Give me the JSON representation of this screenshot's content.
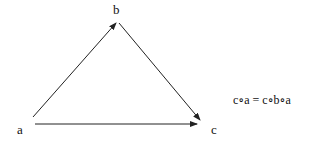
{
  "diagram": {
    "nodes": [
      {
        "id": "a",
        "label": "a",
        "x": 20,
        "y": 134
      },
      {
        "id": "b",
        "label": "b",
        "x": 117,
        "y": 14
      },
      {
        "id": "c",
        "label": "c",
        "x": 214,
        "y": 134
      }
    ],
    "edges": [
      {
        "from": "a",
        "to": "b"
      },
      {
        "from": "b",
        "to": "c"
      },
      {
        "from": "a",
        "to": "c"
      }
    ],
    "equation": "c∘a = c∘b∘a",
    "colors": {
      "stroke": "#222222",
      "text": "#111111",
      "background": "#ffffff"
    }
  }
}
